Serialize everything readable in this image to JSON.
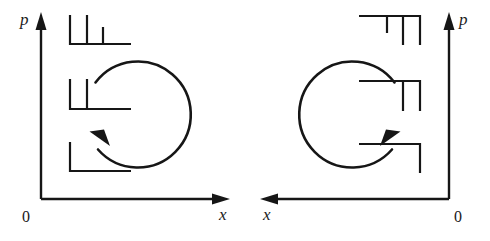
{
  "figure": {
    "background_color": "#ffffff",
    "stroke_color": "#161616",
    "width": 490,
    "height": 241
  },
  "panels": [
    {
      "id": "left",
      "axes": {
        "vertical_label": "p",
        "horizontal_label": "x",
        "origin_label": "0",
        "vertical_direction": "up",
        "horizontal_direction": "right"
      },
      "trajectory": {
        "shape": "circle",
        "direction": "counterclockwise",
        "gap_side": "left",
        "arrow_position": "lower-left"
      },
      "combs": [
        {
          "id": "top",
          "ticks": 3,
          "baseline": "bottom",
          "tick_direction": "up"
        },
        {
          "id": "middle",
          "ticks": 2,
          "baseline": "bottom",
          "tick_direction": "up"
        },
        {
          "id": "bottom",
          "ticks": 1,
          "baseline": "bottom",
          "tick_direction": "up"
        }
      ]
    },
    {
      "id": "right",
      "axes": {
        "vertical_label": "p",
        "horizontal_label": "x",
        "origin_label": "0",
        "vertical_direction": "up",
        "horizontal_direction": "left"
      },
      "trajectory": {
        "shape": "circle",
        "direction": "clockwise",
        "gap_side": "right",
        "arrow_position": "lower-right"
      },
      "combs": [
        {
          "id": "top",
          "ticks": 3,
          "baseline": "top",
          "tick_direction": "down"
        },
        {
          "id": "middle",
          "ticks": 2,
          "baseline": "top",
          "tick_direction": "down"
        },
        {
          "id": "bottom",
          "ticks": 1,
          "baseline": "top",
          "tick_direction": "down"
        }
      ]
    }
  ]
}
